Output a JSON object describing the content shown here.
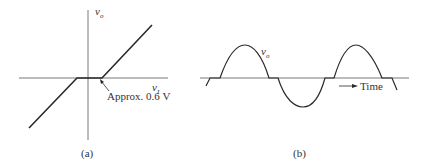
{
  "panels": [
    {
      "id": "a",
      "caption": "(a)",
      "y_axis_label": "v",
      "y_axis_sub": "o",
      "x_axis_label": "v",
      "x_axis_sub": "I",
      "annotation": "Approx. 0.6 V",
      "description": "Transfer characteristic: output zero between about -0.6 V and +0.6 V, linear slope outside"
    },
    {
      "id": "b",
      "caption": "(b)",
      "waveform_label": "v",
      "waveform_sub": "o",
      "time_label": "Time",
      "description": "Output sine wave with crossover distortion (flat regions at zero crossings)"
    }
  ],
  "colors": {
    "line": "#2a2a2a",
    "axis": "#555555",
    "text": "#333333"
  }
}
